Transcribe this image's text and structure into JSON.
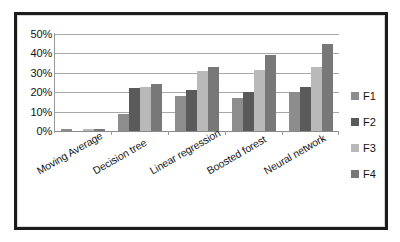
{
  "chart_data": {
    "type": "bar",
    "title": "",
    "subtitle": "",
    "xlabel": "",
    "ylabel": "",
    "categories": [
      "Moving Average",
      "Decision tree",
      "Linear regression",
      "Boosted forest",
      "Neural network"
    ],
    "series": [
      {
        "name": "F1",
        "color": "#8d8d8d",
        "values": [
          1,
          9,
          18,
          17,
          20
        ]
      },
      {
        "name": "F2",
        "color": "#5a5a5a",
        "values": [
          0,
          22,
          21,
          20,
          22.5
        ]
      },
      {
        "name": "F3",
        "color": "#b9b9b9",
        "values": [
          1,
          22.5,
          31,
          31.5,
          33
        ]
      },
      {
        "name": "F4",
        "color": "#787878",
        "values": [
          1,
          24,
          33,
          39,
          45
        ]
      }
    ],
    "ylim": [
      0,
      50
    ],
    "y_ticks": [
      "0%",
      "10%",
      "20%",
      "30%",
      "40%",
      "50%"
    ],
    "y_tick_values": [
      0,
      10,
      20,
      30,
      40,
      50
    ],
    "grid": true,
    "legend_position": "right",
    "legend_entries": [
      "F1",
      "F2",
      "F3",
      "F4"
    ],
    "value_suffix": "%"
  },
  "style": {
    "frame_color": "#1c1c1c",
    "gridline_color": "#a8a8a8",
    "axis_color": "#9a9a9a",
    "background": "#ffffff",
    "text_color": "#121212"
  }
}
